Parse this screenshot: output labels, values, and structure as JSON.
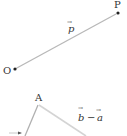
{
  "diagram": {
    "top": {
      "origin_label": "O",
      "end_label": "P",
      "vector_label": "p",
      "vector_arrow": "→"
    },
    "bottom": {
      "vertex_label": "A",
      "vector_label_b": "b",
      "vector_label_a": "a",
      "operator": "−",
      "vector_arrow": "→"
    },
    "colors": {
      "line": "#b8b8b8",
      "line_light": "#d4d4d4",
      "text": "#333333",
      "point": "#222222"
    }
  }
}
